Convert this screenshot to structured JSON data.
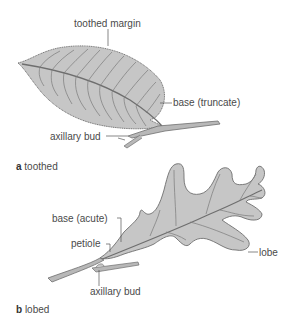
{
  "figure": {
    "panels": [
      {
        "letter": "a",
        "caption": "toothed",
        "labels": {
          "margin": "toothed margin",
          "base": "base (truncate)",
          "bud": "axillary bud"
        }
      },
      {
        "letter": "b",
        "caption": "lobed",
        "labels": {
          "base": "base (acute)",
          "petiole": "petiole",
          "lobe": "lobe",
          "bud": "axillary bud"
        }
      }
    ],
    "colors": {
      "leaf_fill": "#c6c6c6",
      "leaf_stroke": "#6e6e6e",
      "vein": "#7a7a7a",
      "leader": "#555555",
      "text": "#4a4a4a"
    }
  }
}
